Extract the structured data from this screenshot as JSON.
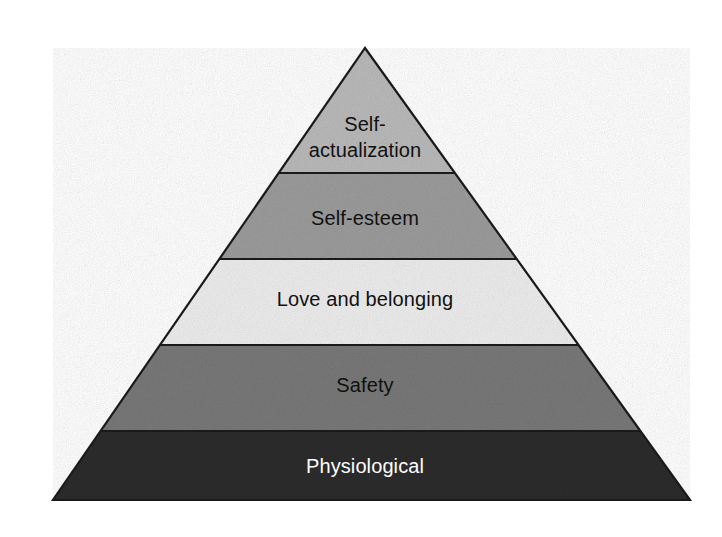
{
  "figure": {
    "name": "maslow-hierarchy-of-needs-pyramid",
    "shape": "pyramid",
    "background_color": "#ffffff",
    "outline_color": "#1a1a1a",
    "apex": {
      "x": 365,
      "y": 48
    },
    "base_left": {
      "x": 53,
      "y": 500
    },
    "base_right": {
      "x": 690,
      "y": 500
    },
    "tiers": [
      {
        "label": "Self-\nactualization",
        "label_plain": "Self-actualization",
        "level": 5,
        "fill": "#b9b9b9",
        "text_color": "#111111",
        "y_top": 48,
        "y_bottom": 173,
        "label_center_x": 365,
        "label_center_y": 137
      },
      {
        "label": "Self-esteem",
        "label_plain": "Self-esteem",
        "level": 4,
        "fill": "#9b9b9b",
        "text_color": "#111111",
        "y_top": 173,
        "y_bottom": 259,
        "label_center_x": 365,
        "label_center_y": 218
      },
      {
        "label": "Love and belonging",
        "label_plain": "Love and belonging",
        "level": 3,
        "fill": "#ececec",
        "text_color": "#111111",
        "y_top": 259,
        "y_bottom": 345,
        "label_center_x": 365,
        "label_center_y": 299
      },
      {
        "label": "Safety",
        "label_plain": "Safety",
        "level": 2,
        "fill": "#787878",
        "text_color": "#111111",
        "y_top": 345,
        "y_bottom": 431,
        "label_center_x": 365,
        "label_center_y": 385
      },
      {
        "label": "Physiological",
        "label_plain": "Physiological",
        "level": 1,
        "fill": "#2d2d2d",
        "text_color": "#fdfdfd",
        "y_top": 431,
        "y_bottom": 500,
        "label_center_x": 365,
        "label_center_y": 466
      }
    ]
  }
}
